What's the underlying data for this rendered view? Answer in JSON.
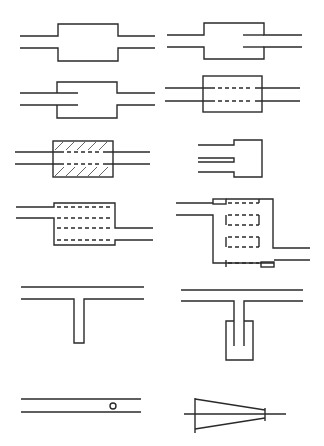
{
  "figure": {
    "stroke_color": "#2a2a2a",
    "background": "#ffffff",
    "elements": [
      {
        "id": "simple-expansion-chamber",
        "row": 1,
        "col": 1
      },
      {
        "id": "expansion-chamber-extended-outlet",
        "row": 1,
        "col": 2
      },
      {
        "id": "expansion-chamber-extended-inlet",
        "row": 2,
        "col": 1
      },
      {
        "id": "perforated-tube-chamber",
        "row": 2,
        "col": 2
      },
      {
        "id": "absorptive-perforated-chamber",
        "row": 3,
        "col": 1
      },
      {
        "id": "closed-end-extended-pipe-chamber",
        "row": 3,
        "col": 2
      },
      {
        "id": "offset-perforated-multi-tube-chamber",
        "row": 4,
        "col": 1
      },
      {
        "id": "multi-chamber-reversing-perforated",
        "row": 4,
        "col": 2
      },
      {
        "id": "quarter-wave-side-branch",
        "row": 5,
        "col": 1
      },
      {
        "id": "helmholtz-resonator-side-branch",
        "row": 5,
        "col": 2
      },
      {
        "id": "pipe-with-orifice-hole",
        "row": 6,
        "col": 1
      },
      {
        "id": "conical-diffuser",
        "row": 6,
        "col": 2
      }
    ]
  }
}
